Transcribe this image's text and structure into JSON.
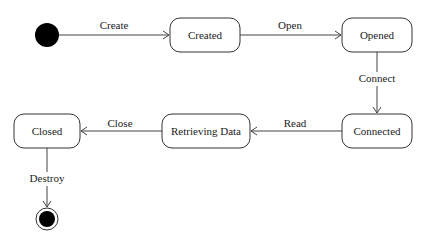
{
  "diagram": {
    "type": "uml-state-machine",
    "states": [
      {
        "id": "created",
        "label": "Created"
      },
      {
        "id": "opened",
        "label": "Opened"
      },
      {
        "id": "connected",
        "label": "Connected"
      },
      {
        "id": "retrieving",
        "label": "Retrieving Data"
      },
      {
        "id": "closed",
        "label": "Closed"
      }
    ],
    "transitions": [
      {
        "from": "initial",
        "to": "created",
        "label": "Create"
      },
      {
        "from": "created",
        "to": "opened",
        "label": "Open"
      },
      {
        "from": "opened",
        "to": "connected",
        "label": "Connect"
      },
      {
        "from": "connected",
        "to": "retrieving",
        "label": "Read"
      },
      {
        "from": "retrieving",
        "to": "closed",
        "label": "Close"
      },
      {
        "from": "closed",
        "to": "final",
        "label": "Destroy"
      }
    ],
    "colors": {
      "stroke": "#333333",
      "fill": "#ffffff",
      "node_fill": "#000000"
    }
  }
}
